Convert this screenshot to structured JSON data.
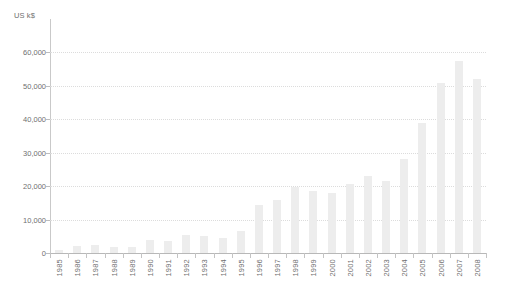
{
  "chart_data": {
    "type": "bar",
    "title": "",
    "subtitle": "",
    "xlabel": "",
    "ylabel": "US k$",
    "ylim": [
      0,
      70000
    ],
    "ytick_values": [
      0,
      10000,
      20000,
      30000,
      40000,
      50000,
      60000
    ],
    "ytick_labels": [
      "0",
      "10,000",
      "20,000",
      "30,000",
      "40,000",
      "50,000",
      "60,000"
    ],
    "grid": true,
    "grid_axis": "y",
    "legend": null,
    "legend_position": "none",
    "annotations": [],
    "bar_color": "#ededed",
    "axis_color": "#bdbdbd",
    "gridline_color": "#dcdcdc",
    "text_color": "#6f6f6f",
    "background_color": "#ffffff",
    "categories": [
      "1985",
      "1986",
      "1987",
      "1988",
      "1989",
      "1990",
      "1991",
      "1992",
      "1993",
      "1994",
      "1995",
      "1996",
      "1997",
      "1998",
      "1999",
      "2000",
      "2001",
      "2002",
      "2003",
      "2004",
      "2005",
      "2006",
      "2007",
      "2008"
    ],
    "values": [
      1000,
      2000,
      2500,
      1800,
      1700,
      3800,
      3600,
      5500,
      5000,
      4500,
      6600,
      14500,
      16000,
      19800,
      18500,
      18000,
      20500,
      23000,
      21500,
      28000,
      39000,
      51000,
      57500,
      52000
    ],
    "series": [
      {
        "name": "US k$",
        "values": [
          1000,
          2000,
          2500,
          1800,
          1700,
          3800,
          3600,
          5500,
          5000,
          4500,
          6600,
          14500,
          16000,
          19800,
          18500,
          18000,
          20500,
          23000,
          21500,
          28000,
          39000,
          51000,
          57500,
          52000
        ]
      }
    ]
  }
}
